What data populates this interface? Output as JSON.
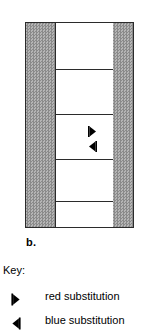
{
  "figure": {
    "panel_label": "b.",
    "border_color": "#2b2b2b",
    "band_color": "#9a9a9a",
    "center_color": "#ffffff",
    "markers": [
      {
        "icon": "triangle-right-icon",
        "meaning": "red substitution",
        "x": 62,
        "y": 106
      },
      {
        "icon": "triangle-left-icon",
        "meaning": "blue substitution",
        "x": 62,
        "y": 121
      }
    ],
    "horizontal_dividers_y": [
      46,
      91,
      136,
      178
    ],
    "vertical_divider_x": 29
  },
  "key": {
    "heading": "Key:",
    "entries": [
      {
        "icon": "triangle-right-icon",
        "label": "red substitution"
      },
      {
        "icon": "triangle-left-icon",
        "label": "blue substitution"
      }
    ]
  }
}
